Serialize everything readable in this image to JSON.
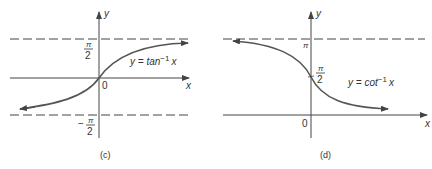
{
  "panels": [
    {
      "id": "c",
      "caption": "(c)",
      "function_label": "y = tan",
      "function_sup": "−1",
      "function_var": "x",
      "x_axis_label": "x",
      "y_axis_label": "y",
      "origin_label": "0",
      "upper_asymptote": {
        "num": "π",
        "den": "2",
        "sign": ""
      },
      "lower_asymptote": {
        "num": "π",
        "den": "2",
        "sign": "−"
      }
    },
    {
      "id": "d",
      "caption": "(d)",
      "function_label": "y = cot",
      "function_sup": "−1",
      "function_var": "x",
      "x_axis_label": "x",
      "y_axis_label": "y",
      "origin_label": "0",
      "upper_asymptote": {
        "label": "π"
      },
      "y_intercept": {
        "num": "π",
        "den": "2"
      }
    }
  ],
  "colors": {
    "curve": "#555555",
    "axis": "#444444",
    "asymptote": "#444444"
  }
}
